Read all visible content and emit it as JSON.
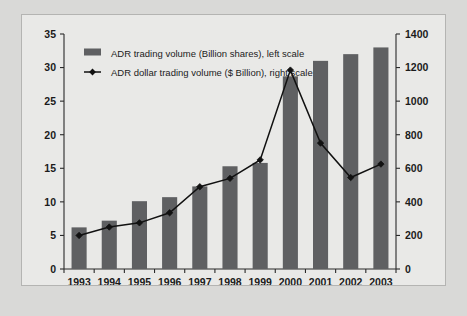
{
  "chart_data": {
    "type": "bar",
    "title": "",
    "subtitle": "",
    "xlabel": "",
    "ylabel": "",
    "categories": [
      "1993",
      "1994",
      "1995",
      "1996",
      "1997",
      "1998",
      "1999",
      "2000",
      "2001",
      "2002",
      "2003"
    ],
    "grid": false,
    "legend_position": "top-left",
    "axes": {
      "left": {
        "label": "ADR trading volume (Billion shares)",
        "ticks": [
          "0",
          "5",
          "10",
          "15",
          "20",
          "25",
          "30",
          "35"
        ],
        "values": [
          0,
          5,
          10,
          15,
          20,
          25,
          30,
          35
        ],
        "min": 0,
        "max": 35
      },
      "right": {
        "label": "ADR dollar trading volume ($ Billion)",
        "ticks": [
          "0",
          "200",
          "400",
          "600",
          "800",
          "1000",
          "1200",
          "1400"
        ],
        "values": [
          0,
          200,
          400,
          600,
          800,
          1000,
          1200,
          1400
        ],
        "min": 0,
        "max": 1400
      }
    },
    "series": [
      {
        "name": "ADR trading volume (Billion shares), left scale",
        "type": "bar",
        "axis": "left",
        "color": "#5f6062",
        "values": [
          6.2,
          7.2,
          10.1,
          10.7,
          12.3,
          15.3,
          15.8,
          28.7,
          31.0,
          32.0,
          33.0
        ]
      },
      {
        "name": "ADR dollar trading volume ($ Billion), right scale",
        "type": "line",
        "axis": "right",
        "color": "#111111",
        "values": [
          200,
          250,
          275,
          335,
          490,
          540,
          650,
          1185,
          750,
          545,
          625
        ]
      }
    ]
  },
  "legend": {
    "items": [
      {
        "label": "ADR trading volume (Billion shares), left scale",
        "marker": "swatch",
        "color": "#5f6062"
      },
      {
        "label": "ADR dollar trading volume ($ Billion), right scale",
        "marker": "line-diamond",
        "color": "#111111"
      }
    ]
  }
}
